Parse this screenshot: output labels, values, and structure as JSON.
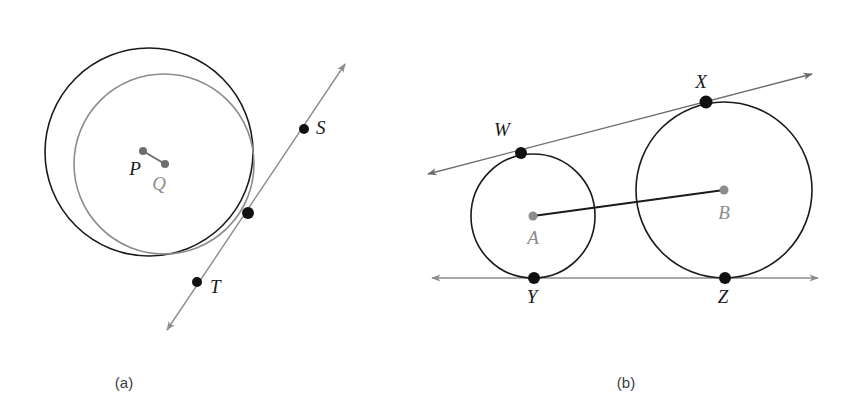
{
  "figure": {
    "background_color": "#ffffff",
    "colors": {
      "dark_stroke": "#1a1a1a",
      "gray_stroke": "#8c8c8c",
      "mid_gray_stroke": "#6e6e6e",
      "point_dark": "#111111",
      "point_gray": "#8c8c8c",
      "label_dark": "#1a1a1a",
      "label_gray": "#8c8c8c",
      "caption": "#3d3d3d"
    },
    "panels": [
      {
        "id": "panel-a",
        "caption": "(a)",
        "caption_x": 124,
        "caption_y": 388,
        "description": "Two internally tangent circles P and Q with a common tangent line through S and T",
        "circles": [
          {
            "name": "circle-p",
            "label": "P",
            "center_x": 149,
            "center_y": 152,
            "radius": 104,
            "stroke": "#1a1a1a",
            "stroke_width": 1.6,
            "label_x": 135,
            "label_y": 175,
            "label_color": "dark",
            "center_dot_color": "#6e6e6e",
            "center_dot_r": 4
          },
          {
            "name": "circle-q",
            "label": "Q",
            "center_x": 164,
            "center_y": 164,
            "radius": 90,
            "stroke": "#8c8c8c",
            "stroke_width": 1.6,
            "label_x": 159,
            "label_y": 190,
            "label_color": "gray",
            "center_dot_color": "#6e6e6e",
            "center_dot_r": 4
          }
        ],
        "radius_segment": {
          "name": "segment-pq",
          "x1": 143,
          "y1": 151,
          "x2": 165,
          "y2": 164,
          "stroke": "#6e6e6e",
          "stroke_width": 2
        },
        "tangent_line": {
          "name": "tangent-line-st",
          "x1": 345,
          "y1": 64,
          "x2": 167,
          "y2": 330,
          "stroke": "#8c8c8c",
          "stroke_width": 1.4,
          "arrows": "both"
        },
        "points": [
          {
            "name": "point-tangency-a",
            "label": "",
            "x": 248,
            "y": 213,
            "r": 6,
            "color": "#111111"
          },
          {
            "name": "point-s",
            "label": "S",
            "x": 304,
            "y": 129,
            "r": 5,
            "color": "#111111",
            "label_x": 316,
            "label_y": 134,
            "label_color": "dark"
          },
          {
            "name": "point-t",
            "label": "T",
            "x": 197,
            "y": 282,
            "r": 5,
            "color": "#111111",
            "label_x": 210,
            "label_y": 293,
            "label_color": "dark"
          }
        ]
      },
      {
        "id": "panel-b",
        "caption": "(b)",
        "caption_x": 626,
        "caption_y": 388,
        "description": "Two externally tangent-adjacent circles A and B with two common tangent lines touching at W, X, Y, Z",
        "circles": [
          {
            "name": "circle-a",
            "label": "A",
            "center_x": 533,
            "center_y": 216,
            "radius": 62,
            "stroke": "#1a1a1a",
            "stroke_width": 1.6,
            "label_x": 528,
            "label_y": 244,
            "label_color": "gray",
            "center_dot_color": "#8c8c8c",
            "center_dot_r": 4.5
          },
          {
            "name": "circle-b",
            "label": "B",
            "center_x": 724,
            "center_y": 190,
            "radius": 88,
            "stroke": "#1a1a1a",
            "stroke_width": 1.6,
            "label_x": 718,
            "label_y": 219,
            "label_color": "gray",
            "center_dot_color": "#8c8c8c",
            "center_dot_r": 4.5
          }
        ],
        "radius_segment": {
          "name": "segment-ab",
          "x1": 533,
          "y1": 216,
          "x2": 724,
          "y2": 190,
          "stroke": "#1a1a1a",
          "stroke_width": 1.8
        },
        "tangent_lines": [
          {
            "name": "tangent-line-upper-wx",
            "x1": 428,
            "y1": 174,
            "x2": 812,
            "y2": 74,
            "stroke": "#6e6e6e",
            "stroke_width": 1.3,
            "arrows": "both"
          },
          {
            "name": "tangent-line-lower-yz",
            "x1": 432,
            "y1": 278,
            "x2": 818,
            "y2": 278,
            "stroke": "#8c8c8c",
            "stroke_width": 1.4,
            "arrows": "both"
          }
        ],
        "points": [
          {
            "name": "point-w",
            "label": "W",
            "x": 521,
            "y": 153,
            "r": 6,
            "color": "#111111",
            "label_x": 502,
            "label_y": 136,
            "label_color": "dark"
          },
          {
            "name": "point-x",
            "label": "X",
            "x": 706,
            "y": 102,
            "r": 6.5,
            "color": "#111111",
            "label_x": 697,
            "label_y": 88,
            "label_color": "dark"
          },
          {
            "name": "point-y",
            "label": "Y",
            "x": 534,
            "y": 278,
            "r": 6,
            "color": "#111111",
            "label_x": 527,
            "label_y": 303,
            "label_color": "dark"
          },
          {
            "name": "point-z",
            "label": "Z",
            "x": 725,
            "y": 278,
            "r": 6,
            "color": "#111111",
            "label_x": 718,
            "label_y": 303,
            "label_color": "dark"
          }
        ]
      }
    ]
  }
}
